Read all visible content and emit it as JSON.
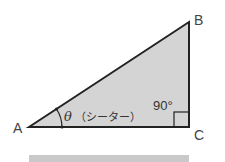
{
  "diagram": {
    "vertices": {
      "A": {
        "label": "A"
      },
      "B": {
        "label": "B"
      },
      "C": {
        "label": "C"
      }
    },
    "angle_label": "θ（シータ）",
    "theta_symbol": "θ",
    "theta_reading": "（シーター）",
    "right_angle_label": "90°",
    "colors": {
      "fill": "#d4d4d4",
      "stroke": "#222222",
      "bar": "#c9c9c9"
    }
  }
}
